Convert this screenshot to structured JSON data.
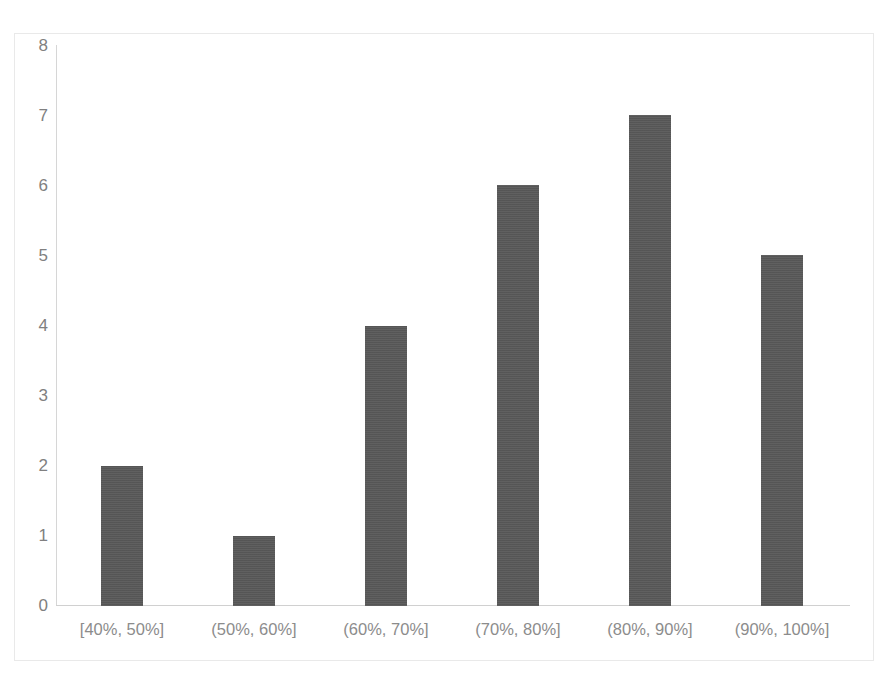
{
  "chart_data": {
    "type": "bar",
    "title": "",
    "subtitle": "",
    "xlabel": "",
    "ylabel": "",
    "categories": [
      "[40%, 50%]",
      "(50%, 60%]",
      "(60%, 70%]",
      "(70%, 80%]",
      "(80%, 90%]",
      "(90%, 100%]"
    ],
    "values": [
      2,
      1,
      4,
      6,
      7,
      5
    ],
    "ylim": [
      0,
      8
    ],
    "ytick_labels": [
      "8",
      "7",
      "6",
      "5",
      "4",
      "3",
      "2",
      "1",
      "0"
    ],
    "ytick_values": [
      8,
      7,
      6,
      5,
      4,
      3,
      2,
      1,
      0
    ],
    "grid": false,
    "legend": false,
    "legend_position": "none",
    "bar_color": "#595959",
    "axis_color": "#d0d0d0",
    "tick_label_color": "#808080",
    "plot_background": "#ffffff"
  }
}
